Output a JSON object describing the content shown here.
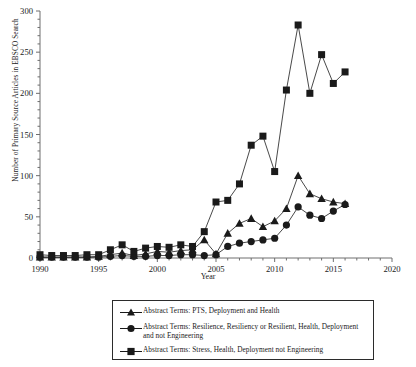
{
  "chart_data": {
    "type": "line",
    "title": "",
    "xlabel": "Year",
    "ylabel": "Number of Primary Source Articles in EBSCO Search",
    "xlim": [
      1990,
      2020
    ],
    "ylim": [
      0,
      300
    ],
    "xticks": [
      1990,
      1995,
      2000,
      2005,
      2010,
      2015,
      2020
    ],
    "yticks": [
      0,
      50,
      100,
      150,
      200,
      250,
      300
    ],
    "yticks_minor_step": 10,
    "grid": false,
    "legend_position": "below-plot",
    "series": [
      {
        "name": "Abstract Terms: PTS, Deployment and Health",
        "marker": "triangle",
        "x": [
          1990,
          1991,
          1992,
          1993,
          1994,
          1995,
          1996,
          1997,
          1998,
          1999,
          2000,
          2001,
          2002,
          2003,
          2004,
          2005,
          2006,
          2007,
          2008,
          2009,
          2010,
          2011,
          2012,
          2013,
          2014,
          2015,
          2016
        ],
        "values": [
          1,
          1,
          1,
          1,
          1,
          2,
          4,
          6,
          3,
          5,
          8,
          7,
          9,
          10,
          22,
          5,
          30,
          42,
          48,
          38,
          45,
          60,
          100,
          78,
          72,
          68,
          66
        ]
      },
      {
        "name": "Abstract Terms: Resilience, Resiliency or Resilient, Health, Deployment and not Engineering",
        "marker": "circle",
        "x": [
          1990,
          1991,
          1992,
          1993,
          1994,
          1995,
          1996,
          1997,
          1998,
          1999,
          2000,
          2001,
          2002,
          2003,
          2004,
          2005,
          2006,
          2007,
          2008,
          2009,
          2010,
          2011,
          2012,
          2013,
          2014,
          2015,
          2016
        ],
        "values": [
          1,
          1,
          1,
          1,
          1,
          1,
          2,
          3,
          2,
          2,
          3,
          3,
          4,
          4,
          3,
          4,
          14,
          18,
          20,
          22,
          24,
          40,
          62,
          52,
          48,
          57,
          65
        ]
      },
      {
        "name": "Abstract Terms: Stress, Health, Deployment not Engineering",
        "marker": "square",
        "x": [
          1990,
          1991,
          1992,
          1993,
          1994,
          1995,
          1996,
          1997,
          1998,
          1999,
          2000,
          2001,
          2002,
          2003,
          2004,
          2005,
          2006,
          2007,
          2008,
          2009,
          2010,
          2011,
          2012,
          2013,
          2014,
          2015,
          2016
        ],
        "values": [
          4,
          3,
          3,
          3,
          4,
          4,
          10,
          16,
          8,
          12,
          14,
          13,
          16,
          14,
          32,
          68,
          70,
          90,
          137,
          148,
          105,
          204,
          283,
          200,
          247,
          212,
          226
        ]
      }
    ]
  },
  "axes": {
    "x_tick_labels": [
      "1990",
      "1995",
      "2000",
      "2005",
      "2010",
      "2015",
      "2020"
    ],
    "y_tick_labels": [
      "0",
      "50",
      "100",
      "150",
      "200",
      "250",
      "300"
    ],
    "xlabel": "Year",
    "ylabel": "Number of Primary Source Articles in EBSCO Search"
  },
  "legend": {
    "entries": [
      {
        "marker": "triangle",
        "label": "Abstract Terms: PTS, Deployment and Health"
      },
      {
        "marker": "circle",
        "label": "Abstract Terms: Resilience, Resiliency or Resilient, Health, Deployment and not Engineering"
      },
      {
        "marker": "square",
        "label": "Abstract Terms: Stress, Health, Deployment not Engineering"
      }
    ]
  },
  "colors": {
    "ink": "#1a1a1a",
    "axis": "#6e6e6e",
    "background": "#ffffff"
  }
}
